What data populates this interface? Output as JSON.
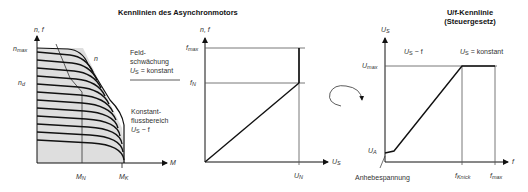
{
  "titles": {
    "left": "Kennlinien des Asynchronmotors",
    "right_line1": "U/f-Kennlinie",
    "right_line2": "(Steuergesetz)"
  },
  "left_chart": {
    "y_axis_label": "n, f",
    "x_axis_label": "M",
    "y_ticks": {
      "n_max": "n",
      "n_max_sub": "max",
      "n_d": "n",
      "n_d_sub": "d"
    },
    "x_ticks": {
      "M_N": "M",
      "M_N_sub": "N",
      "M_K": "M",
      "M_K_sub": "K"
    },
    "curve_label": "n",
    "region_field_weakening": {
      "line1": "Feld-",
      "line2": "schwächung",
      "line3_pre": "U",
      "line3_sub": "S",
      "line3_post": " = konstant"
    },
    "region_constant_flux": {
      "line1": "Konstant-",
      "line2": "flussbereich",
      "line3_pre": "U",
      "line3_sub": "S",
      "line3_post": " ~ f"
    }
  },
  "middle_chart": {
    "y_axis_label": "n, f",
    "x_axis_label": "U",
    "x_axis_label_sub": "S",
    "y_ticks": {
      "f_max": "f",
      "f_max_sub": "max",
      "f_N": "f",
      "f_N_sub": "N"
    },
    "x_ticks": {
      "U_N": "U",
      "U_N_sub": "N"
    }
  },
  "right_chart": {
    "y_axis_label": "U",
    "y_axis_label_sub": "S",
    "x_axis_label": "f",
    "y_ticks": {
      "U_max": "U",
      "U_max_sub": "max",
      "U_A": "U",
      "U_A_sub": "A"
    },
    "x_ticks": {
      "f_Knick": "f",
      "f_Knick_sub": "Knick",
      "f_max": "f",
      "f_max_sub": "max"
    },
    "region_left": {
      "pre": "U",
      "sub": "S",
      "post": " ~ f"
    },
    "region_right": {
      "pre": "U",
      "sub": "S",
      "post": " = konstant"
    },
    "boost_label": "Anhebespannung"
  },
  "colors": {
    "shade": "#dedede",
    "line": "#111111",
    "thin": "#555555"
  }
}
